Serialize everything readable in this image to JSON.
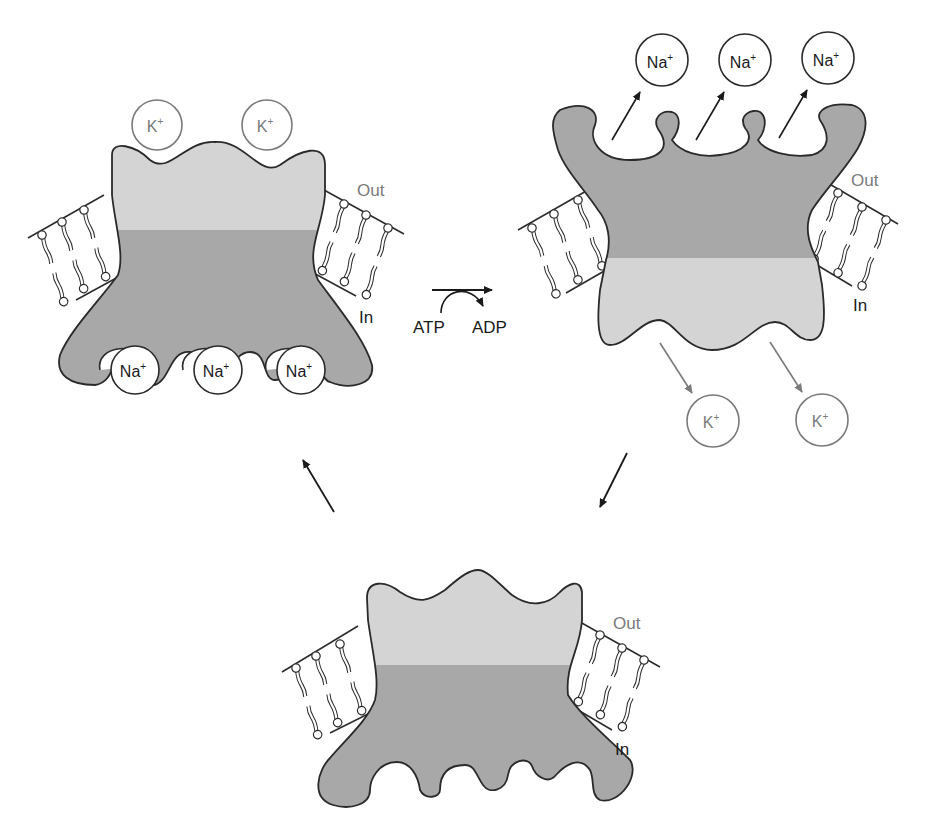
{
  "colors": {
    "outline": "#2a2a2a",
    "light_domain": "#d4d4d4",
    "dark_domain": "#a8a8a8",
    "k_ion": "#7a7a7a",
    "na_ion": "#1a1a1a",
    "out_label": "#7a7a7a",
    "in_label": "#1a1a1a"
  },
  "labels": {
    "out": "Out",
    "in": "In",
    "atp": "ATP",
    "adp": "ADP"
  },
  "ions": {
    "k": {
      "symbol": "K",
      "charge": "+"
    },
    "na": {
      "symbol": "Na",
      "charge": "+"
    }
  },
  "states": [
    {
      "id": "state-1",
      "position": "top-left",
      "description": "Na+ bound on cytoplasmic side; K+ approaching extracellular side",
      "bound_na": 3,
      "nearby_k": 2
    },
    {
      "id": "state-2",
      "position": "top-right",
      "description": "Phosphorylated pump releases 3 Na+ outside; releases 2 K+ inside",
      "released_na": 3,
      "released_k": 2
    },
    {
      "id": "state-3",
      "position": "bottom",
      "description": "Pump open to cytoplasm with empty Na+ binding sites"
    }
  ],
  "transitions": [
    {
      "from": "state-1",
      "to": "state-2",
      "note": "ATP → ADP"
    },
    {
      "from": "state-2",
      "to": "state-3"
    },
    {
      "from": "state-3",
      "to": "state-1"
    }
  ]
}
